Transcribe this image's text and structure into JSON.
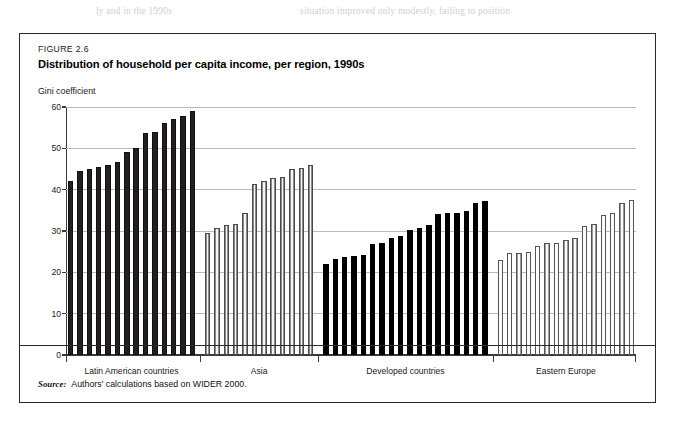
{
  "page_bleed": {
    "left_fragment": "ly and in the 1990s",
    "right_fragment": "situation improved only modestly, failing to position"
  },
  "figure": {
    "number": "FIGURE 2.6",
    "title": "Distribution of household per capita income, per region, 1990s",
    "axis_title": "Gini coefficient",
    "source_lead": "Source:",
    "source_text": "Authors' calculations based on WIDER 2000."
  },
  "colors": {
    "latin_fill": "#231f20",
    "asia_fill": "#f4f4f4",
    "developed_fill": "#000000",
    "eastern_fill": "#fbfbfb",
    "frame": "#2a2a2a",
    "grid": "#b9b9b9",
    "axis": "#3a3a3a"
  },
  "chart_data": {
    "type": "bar",
    "title": "Distribution of household per capita income, per region, 1990s",
    "subtitle": "FIGURE 2.6",
    "xlabel": "",
    "ylabel": "Gini coefficient",
    "ylim": [
      0,
      60
    ],
    "yticks": [
      0,
      10,
      20,
      30,
      40,
      50,
      60
    ],
    "ytick_labels": [
      "0",
      "10",
      "20",
      "30",
      "40",
      "50",
      "60"
    ],
    "grid": true,
    "legend": "none",
    "note": "Each bar is one country; bars are sorted ascending within each region group.",
    "groups": [
      {
        "name": "Latin American countries",
        "fill": "dark",
        "values": [
          42.0,
          44.4,
          45.0,
          45.6,
          45.9,
          46.6,
          49.0,
          50.0,
          53.6,
          54.0,
          56.2,
          57.1,
          57.9,
          59.0
        ]
      },
      {
        "name": "Asia",
        "fill": "outlined-gray",
        "values": [
          29.5,
          30.7,
          31.4,
          31.8,
          34.4,
          41.4,
          42.0,
          42.9,
          43.0,
          44.9,
          45.2,
          46.0
        ]
      },
      {
        "name": "Developed countries",
        "fill": "solid-black",
        "values": [
          22.1,
          23.2,
          23.6,
          23.9,
          24.3,
          26.8,
          27.1,
          28.4,
          28.9,
          30.3,
          30.7,
          31.5,
          34.0,
          34.3,
          34.4,
          34.8,
          36.7,
          37.3
        ]
      },
      {
        "name": "Eastern Europe",
        "fill": "outlined-white",
        "values": [
          23.0,
          24.6,
          24.6,
          25.0,
          26.4,
          27.1,
          27.2,
          27.9,
          28.3,
          31.1,
          31.8,
          33.9,
          34.3,
          36.7,
          37.5
        ]
      }
    ]
  }
}
